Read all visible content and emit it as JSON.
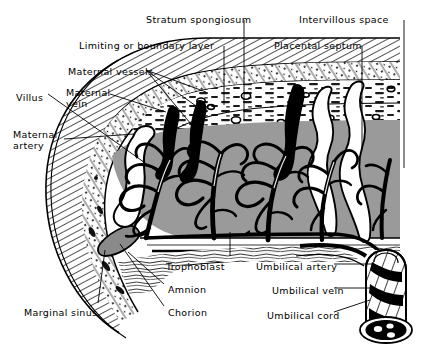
{
  "figure": {
    "width": 425,
    "height": 355,
    "background_color": "#ffffff",
    "ink_color": "#000000",
    "intervillous_gray": "#9a9a9a",
    "decidua_gray": "#c9c9c9"
  },
  "labels": {
    "stratum_spongiosum": "Stratum spongiosum",
    "intervillous_space": "Intervillous space",
    "limiting_layer": "Limiting or boundary layer",
    "placental_septum": "Placental septum",
    "maternal_vessels": "Maternal vessels",
    "villus": "Villus",
    "maternal_vein": "Maternal\nvein",
    "maternal_artery": "Maternal\nartery",
    "trophoblast": "Trophoblast",
    "amnion": "Amnion",
    "chorion": "Chorion",
    "marginal_sinus": "Marginal sinus",
    "umbilical_artery": "Umbilical artery",
    "umbilical_vein": "Umbilical vein",
    "umbilical_cord": "Umbilical cord"
  },
  "label_positions": {
    "stratum_spongiosum": {
      "x": 146,
      "y": 14
    },
    "intervillous_space": {
      "x": 299,
      "y": 14
    },
    "limiting_layer": {
      "x": 79,
      "y": 40
    },
    "placental_septum": {
      "x": 274,
      "y": 40
    },
    "maternal_vessels": {
      "x": 68,
      "y": 66
    },
    "villus": {
      "x": 16,
      "y": 92
    },
    "maternal_vein": {
      "x": 66,
      "y": 88
    },
    "maternal_artery": {
      "x": 13,
      "y": 130
    },
    "trophoblast": {
      "x": 166,
      "y": 261
    },
    "amnion": {
      "x": 168,
      "y": 284
    },
    "chorion": {
      "x": 168,
      "y": 307
    },
    "marginal_sinus": {
      "x": 24,
      "y": 307
    },
    "umbilical_artery": {
      "x": 256,
      "y": 261
    },
    "umbilical_vein": {
      "x": 272,
      "y": 285
    },
    "umbilical_cord": {
      "x": 267,
      "y": 310
    }
  },
  "anatomy": {
    "regions": [
      {
        "name": "uterine-wall-myometrium",
        "description": "curved hatched wall at left and along top"
      },
      {
        "name": "decidua-basalis",
        "description": "stippled band beneath uterine wall"
      },
      {
        "name": "stratum-spongiosum",
        "description": "spongy layer containing maternal vessels"
      },
      {
        "name": "intervillous-space",
        "description": "gray blood-filled lacunar space"
      },
      {
        "name": "chorionic-plate",
        "description": "layered band below intervillous space"
      },
      {
        "name": "amnion-layer",
        "description": "thin lowest membrane"
      }
    ],
    "structures": [
      {
        "name": "maternal-artery",
        "count": 1
      },
      {
        "name": "maternal-vein",
        "count": 3
      },
      {
        "name": "placental-septum",
        "count": 2
      },
      {
        "name": "villous-tree",
        "count": 4
      },
      {
        "name": "marginal-sinus",
        "count": 1
      },
      {
        "name": "umbilical-cord",
        "count": 1
      }
    ]
  }
}
